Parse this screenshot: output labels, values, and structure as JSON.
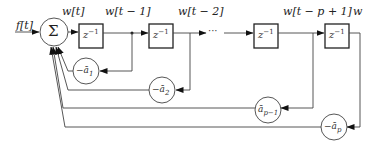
{
  "diagram": {
    "type": "block-diagram",
    "input_label": "f[t]",
    "sum_symbol": "Σ",
    "signal_labels": [
      "w[t]",
      "w[t − 1]",
      "w[t − 2]",
      "w[t − p + 1]",
      "w"
    ],
    "delay_blocks": [
      {
        "label": "z",
        "exponent": "−1"
      },
      {
        "label": "z",
        "exponent": "−1"
      },
      {
        "label": "z",
        "exponent": "−1"
      },
      {
        "label": "z",
        "exponent": "−1"
      }
    ],
    "ellipsis": "···",
    "feedback_coefficients": [
      {
        "prefix": "−ā",
        "subscript": "1"
      },
      {
        "prefix": "−ā",
        "subscript": "2"
      },
      {
        "prefix": "ā",
        "subscript": "p−1"
      },
      {
        "prefix": "−ā",
        "subscript": "p"
      }
    ],
    "colors": {
      "stroke": "#333333",
      "background": "#ffffff"
    }
  }
}
